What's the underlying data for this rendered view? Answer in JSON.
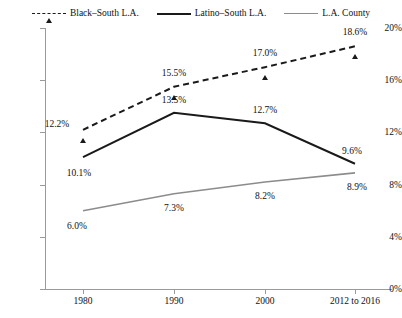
{
  "chart_data": {
    "type": "line",
    "title": "",
    "subtitle": "",
    "xlabel": "",
    "ylabel": "",
    "categories": [
      "1980",
      "1990",
      "2000",
      "2012 to 2016"
    ],
    "x_tick_labels": [
      "1980",
      "1990",
      "2000",
      "2012 to 2016"
    ],
    "y_tick_labels": [
      "0%",
      "4%",
      "8%",
      "12%",
      "16%",
      "20%"
    ],
    "y_tick_values": [
      0,
      4,
      8,
      12,
      16,
      20
    ],
    "ylim": [
      0,
      20
    ],
    "grid": false,
    "legend_position": "top-center",
    "series": [
      {
        "name": "Black–South L.A.",
        "values": [
          12.2,
          15.5,
          17.0,
          18.6
        ],
        "labels": [
          "12.2%",
          "15.5%",
          "17.0%",
          "18.6%"
        ],
        "line_style": "dashed",
        "marker": "triangle",
        "color": "#1a1a1a"
      },
      {
        "name": "Latino–South L.A.",
        "values": [
          10.1,
          13.5,
          12.7,
          9.6
        ],
        "labels": [
          "10.1%",
          "13.5%",
          "12.7%",
          "9.6%"
        ],
        "line_style": "solid",
        "marker": "circle",
        "color": "#1a1a1a"
      },
      {
        "name": "L.A. County",
        "values": [
          6.0,
          7.3,
          8.2,
          8.9
        ],
        "labels": [
          "6.0%",
          "7.3%",
          "8.2%",
          "8.9%"
        ],
        "line_style": "solid",
        "marker": "square",
        "color": "#8c8c8c"
      }
    ]
  },
  "legend": {
    "items": [
      {
        "label": "Black–South L.A."
      },
      {
        "label": "Latino–South L.A."
      },
      {
        "label": "L.A. County"
      }
    ]
  },
  "axes": {
    "y_labels": [
      "20%",
      "16%",
      "12%",
      "8%",
      "4%",
      "0%"
    ],
    "x_labels": [
      "1980",
      "1990",
      "2000",
      "2012 to 2016"
    ]
  },
  "colors": {
    "black_series": "#1a1a1a",
    "gray_series": "#8c8c8c",
    "axis": "#9a9a9a",
    "text": "#111111",
    "background": "#ffffff"
  }
}
